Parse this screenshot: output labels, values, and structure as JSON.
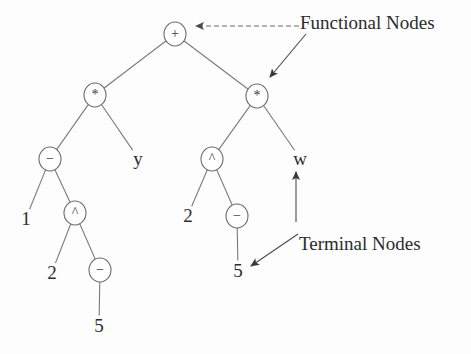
{
  "diagram": {
    "background_color": "#fdfdfd",
    "stroke_color": "#6b6b6b",
    "text_color": "#2b2b2b"
  },
  "annotations": [
    {
      "id": "functional-nodes",
      "label": "Functional Nodes",
      "x": 300,
      "y": 12,
      "font_size": 19
    },
    {
      "id": "terminal-nodes",
      "label": "Terminal Nodes",
      "x": 299,
      "y": 233,
      "font_size": 19
    }
  ],
  "nodes": [
    {
      "id": "n-plus",
      "label": "+",
      "kind": "functional",
      "x": 175,
      "y": 34,
      "r": 11
    },
    {
      "id": "n-mul-left",
      "label": "*",
      "kind": "functional",
      "x": 95,
      "y": 95,
      "r": 11
    },
    {
      "id": "n-mul-right",
      "label": "*",
      "kind": "functional",
      "x": 257,
      "y": 96,
      "r": 11
    },
    {
      "id": "n-minus-l1",
      "label": "−",
      "kind": "functional",
      "x": 50,
      "y": 159,
      "r": 11
    },
    {
      "id": "n-pow-left",
      "label": "^",
      "kind": "functional",
      "x": 75,
      "y": 213,
      "r": 11
    },
    {
      "id": "n-minus-l2",
      "label": "−",
      "kind": "functional",
      "x": 100,
      "y": 270,
      "r": 11
    },
    {
      "id": "n-pow-right",
      "label": "^",
      "kind": "functional",
      "x": 212,
      "y": 159,
      "r": 11
    },
    {
      "id": "n-minus-r1",
      "label": "−",
      "kind": "functional",
      "x": 237,
      "y": 216,
      "r": 11
    }
  ],
  "terminals": [
    {
      "id": "t-y",
      "label": "y",
      "x": 138,
      "y": 158
    },
    {
      "id": "t-1",
      "label": "1",
      "x": 26,
      "y": 218
    },
    {
      "id": "t-2a",
      "label": "2",
      "x": 52,
      "y": 272
    },
    {
      "id": "t-5a",
      "label": "5",
      "x": 99,
      "y": 325
    },
    {
      "id": "t-w",
      "label": "w",
      "x": 300,
      "y": 158
    },
    {
      "id": "t-2b",
      "label": "2",
      "x": 188,
      "y": 215
    },
    {
      "id": "t-5b",
      "label": "5",
      "x": 238,
      "y": 270
    }
  ],
  "edges": [
    {
      "id": "e-plus-mulleft",
      "from": "n-plus",
      "to": "n-mul-left"
    },
    {
      "id": "e-plus-mulright",
      "from": "n-plus",
      "to": "n-mul-right"
    },
    {
      "id": "e-mulleft-minusl1",
      "from": "n-mul-left",
      "to": "n-minus-l1"
    },
    {
      "id": "e-mulleft-y",
      "from": "n-mul-left",
      "to": "t-y"
    },
    {
      "id": "e-minusl1-1",
      "from": "n-minus-l1",
      "to": "t-1"
    },
    {
      "id": "e-minusl1-powleft",
      "from": "n-minus-l1",
      "to": "n-pow-left"
    },
    {
      "id": "e-powleft-2a",
      "from": "n-pow-left",
      "to": "t-2a"
    },
    {
      "id": "e-powleft-minusl2",
      "from": "n-pow-left",
      "to": "n-minus-l2"
    },
    {
      "id": "e-minusl2-5a",
      "from": "n-minus-l2",
      "to": "t-5a"
    },
    {
      "id": "e-mulright-powright",
      "from": "n-mul-right",
      "to": "n-pow-right"
    },
    {
      "id": "e-mulright-w",
      "from": "n-mul-right",
      "to": "t-w"
    },
    {
      "id": "e-powright-2b",
      "from": "n-pow-right",
      "to": "t-2b"
    },
    {
      "id": "e-powright-minusr1",
      "from": "n-pow-right",
      "to": "n-minus-r1"
    },
    {
      "id": "e-minusr1-5b",
      "from": "n-minus-r1",
      "to": "t-5b"
    }
  ],
  "arrows": [
    {
      "id": "arrow-functional-to-plus",
      "style": "dashed",
      "x1": 299,
      "y1": 26,
      "x2": 196,
      "y2": 26,
      "target": "n-plus"
    },
    {
      "id": "arrow-functional-to-mulright",
      "style": "solid",
      "x1": 306,
      "y1": 34,
      "x2": 270,
      "y2": 77,
      "target": "n-mul-right"
    },
    {
      "id": "arrow-terminal-to-w",
      "style": "solid",
      "x1": 296,
      "y1": 222,
      "x2": 296,
      "y2": 172,
      "target": "t-w"
    },
    {
      "id": "arrow-terminal-to-5b",
      "style": "solid",
      "x1": 298,
      "y1": 234,
      "x2": 251,
      "y2": 266,
      "target": "t-5b"
    }
  ]
}
